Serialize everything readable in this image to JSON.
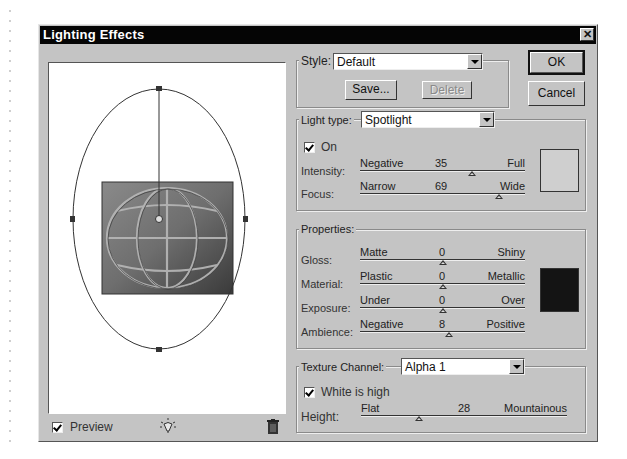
{
  "window": {
    "title": "Lighting Effects",
    "close_label": "✕"
  },
  "style": {
    "label": "Style:",
    "selected": "Default",
    "save_label": "Save...",
    "delete_label": "Delete"
  },
  "buttons": {
    "ok": "OK",
    "cancel": "Cancel"
  },
  "light": {
    "type_label": "Light type:",
    "type_selected": "Spotlight",
    "on_label": "On",
    "on_checked": true,
    "color": "#cfcfcf",
    "sliders": [
      {
        "name": "Intensity:",
        "min_label": "Negative",
        "value": "35",
        "max_label": "Full",
        "position": 0.68
      },
      {
        "name": "Focus:",
        "min_label": "Narrow",
        "value": "69",
        "max_label": "Wide",
        "position": 0.845
      }
    ]
  },
  "properties": {
    "label": "Properties:",
    "color": "#141414",
    "sliders": [
      {
        "name": "Gloss:",
        "min_label": "Matte",
        "value": "0",
        "max_label": "Shiny",
        "position": 0.5
      },
      {
        "name": "Material:",
        "min_label": "Plastic",
        "value": "0",
        "max_label": "Metallic",
        "position": 0.5
      },
      {
        "name": "Exposure:",
        "min_label": "Under",
        "value": "0",
        "max_label": "Over",
        "position": 0.5
      },
      {
        "name": "Ambience:",
        "min_label": "Negative",
        "value": "8",
        "max_label": "Positive",
        "position": 0.54
      }
    ]
  },
  "texture": {
    "channel_label": "Texture Channel:",
    "channel_selected": "Alpha 1",
    "white_is_high_label": "White is high",
    "white_is_high_checked": true,
    "height": {
      "name": "Height:",
      "min_label": "Flat",
      "value": "28",
      "max_label": "Mountainous",
      "position": 0.28
    }
  },
  "preview": {
    "label": "Preview",
    "checked": true,
    "light_icon": "light-bulb-icon",
    "trash_icon": "trash-icon"
  }
}
